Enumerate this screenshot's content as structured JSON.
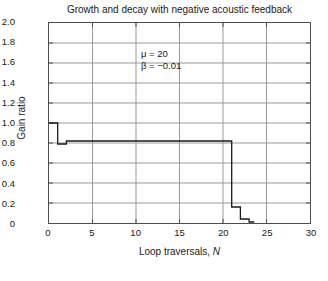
{
  "chart_data": {
    "type": "line",
    "title": "Growth and decay with negative acoustic feedback",
    "xlabel_prefix": "Loop traversals, ",
    "xlabel_variable": "N",
    "ylabel": "Gain ratio",
    "xlim": [
      0,
      30
    ],
    "ylim": [
      0,
      2.0
    ],
    "xticks": [
      0,
      5,
      10,
      15,
      20,
      25,
      30
    ],
    "xtick_labels": [
      "0",
      "5",
      "10",
      "15",
      "20",
      "25",
      "30"
    ],
    "yticks": [
      0,
      0.2,
      0.4,
      0.6,
      0.8,
      1.0,
      1.2,
      1.4,
      1.6,
      1.8,
      2.0
    ],
    "ytick_labels": [
      "0",
      "0.2",
      "0.4",
      "0.6",
      "0.8",
      "1.0",
      "1.2",
      "1.4",
      "1.6",
      "1.8",
      "2.0"
    ],
    "grid": true,
    "grid_color": "#9a9a9a",
    "axis_color": "#4d4d4d",
    "line_color": "#1a1a1a",
    "legend": null,
    "drawstyle": "steps-post",
    "series": [
      {
        "name": "gain ratio",
        "x": [
          0,
          1,
          2,
          3,
          20,
          21,
          22,
          23
        ],
        "values": [
          1.0,
          0.79,
          0.82,
          0.82,
          0.82,
          0.16,
          0.04,
          0.01
        ]
      }
    ],
    "annotations": [
      {
        "name": "parameters",
        "x": 20.3,
        "y": 1.68,
        "lines": [
          "μ = 20",
          "β = −0.01"
        ]
      }
    ]
  }
}
